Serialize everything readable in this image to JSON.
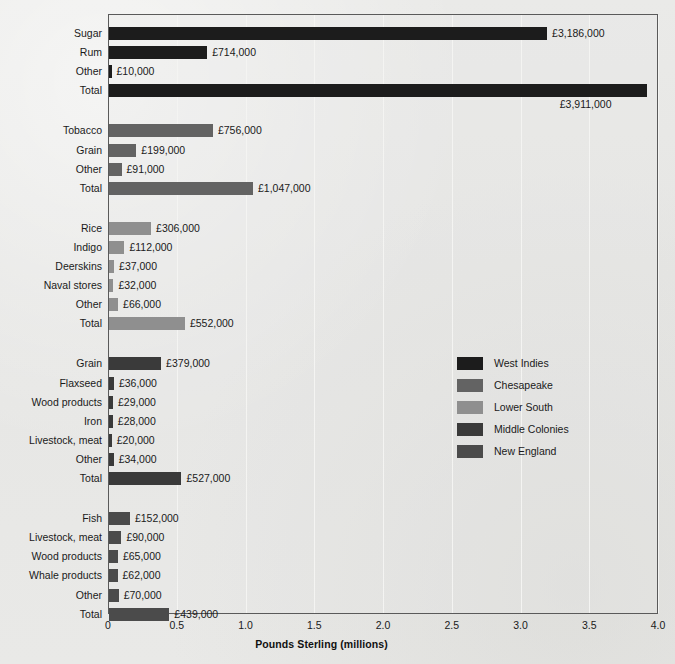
{
  "chart_data": {
    "type": "bar",
    "title": "",
    "subtitle": "",
    "orientation": "horizontal",
    "xlabel": "Pounds Sterling (millions)",
    "ylabel": "",
    "xlim": [
      0,
      4.0
    ],
    "xticks": [
      "0",
      "0.5",
      "1.0",
      "1.5",
      "2.0",
      "2.5",
      "3.0",
      "3.5",
      "4.0"
    ],
    "xtick_values": [
      0,
      0.5,
      1.0,
      1.5,
      2.0,
      2.5,
      3.0,
      3.5,
      4.0
    ],
    "grid": "vertical",
    "legend_position": "center-right",
    "units": "pounds sterling",
    "value_label_format": "£#,###",
    "legend": [
      {
        "name": "West Indies",
        "color": "#1c1c1c"
      },
      {
        "name": "Chesapeake",
        "color": "#636363"
      },
      {
        "name": "Lower South",
        "color": "#8f8f8f"
      },
      {
        "name": "Middle Colonies",
        "color": "#3a3a3a"
      },
      {
        "name": "New England",
        "color": "#4b4b4b"
      }
    ],
    "groups": [
      {
        "name": "West Indies",
        "color": "#1c1c1c",
        "items": [
          {
            "label": "Sugar",
            "value": 3186000,
            "value_label": "£3,186,000",
            "label_below": false
          },
          {
            "label": "Rum",
            "value": 714000,
            "value_label": "£714,000",
            "label_below": false
          },
          {
            "label": "Other",
            "value": 10000,
            "value_label": "£10,000",
            "label_below": false
          },
          {
            "label": "Total",
            "value": 3911000,
            "value_label": "£3,911,000",
            "label_below": true
          }
        ]
      },
      {
        "name": "Chesapeake",
        "color": "#636363",
        "items": [
          {
            "label": "Tobacco",
            "value": 756000,
            "value_label": "£756,000",
            "label_below": false
          },
          {
            "label": "Grain",
            "value": 199000,
            "value_label": "£199,000",
            "label_below": false
          },
          {
            "label": "Other",
            "value": 91000,
            "value_label": "£91,000",
            "label_below": false
          },
          {
            "label": "Total",
            "value": 1047000,
            "value_label": "£1,047,000",
            "label_below": false
          }
        ]
      },
      {
        "name": "Lower South",
        "color": "#8f8f8f",
        "items": [
          {
            "label": "Rice",
            "value": 306000,
            "value_label": "£306,000",
            "label_below": false
          },
          {
            "label": "Indigo",
            "value": 112000,
            "value_label": "£112,000",
            "label_below": false
          },
          {
            "label": "Deerskins",
            "value": 37000,
            "value_label": "£37,000",
            "label_below": false
          },
          {
            "label": "Naval stores",
            "value": 32000,
            "value_label": "£32,000",
            "label_below": false
          },
          {
            "label": "Other",
            "value": 66000,
            "value_label": "£66,000",
            "label_below": false
          },
          {
            "label": "Total",
            "value": 552000,
            "value_label": "£552,000",
            "label_below": false
          }
        ]
      },
      {
        "name": "Middle Colonies",
        "color": "#3a3a3a",
        "items": [
          {
            "label": "Grain",
            "value": 379000,
            "value_label": "£379,000",
            "label_below": false
          },
          {
            "label": "Flaxseed",
            "value": 36000,
            "value_label": "£36,000",
            "label_below": false
          },
          {
            "label": "Wood products",
            "value": 29000,
            "value_label": "£29,000",
            "label_below": false
          },
          {
            "label": "Iron",
            "value": 28000,
            "value_label": "£28,000",
            "label_below": false
          },
          {
            "label": "Livestock, meat",
            "value": 20000,
            "value_label": "£20,000",
            "label_below": false
          },
          {
            "label": "Other",
            "value": 34000,
            "value_label": "£34,000",
            "label_below": false
          },
          {
            "label": "Total",
            "value": 527000,
            "value_label": "£527,000",
            "label_below": false
          }
        ]
      },
      {
        "name": "New England",
        "color": "#4b4b4b",
        "items": [
          {
            "label": "Fish",
            "value": 152000,
            "value_label": "£152,000",
            "label_below": false
          },
          {
            "label": "Livestock, meat",
            "value": 90000,
            "value_label": "£90,000",
            "label_below": false
          },
          {
            "label": "Wood products",
            "value": 65000,
            "value_label": "£65,000",
            "label_below": false
          },
          {
            "label": "Whale products",
            "value": 62000,
            "value_label": "£62,000",
            "label_below": false
          },
          {
            "label": "Other",
            "value": 70000,
            "value_label": "£70,000",
            "label_below": false
          },
          {
            "label": "Total",
            "value": 439000,
            "value_label": "£439,000",
            "label_below": false
          }
        ]
      }
    ]
  }
}
